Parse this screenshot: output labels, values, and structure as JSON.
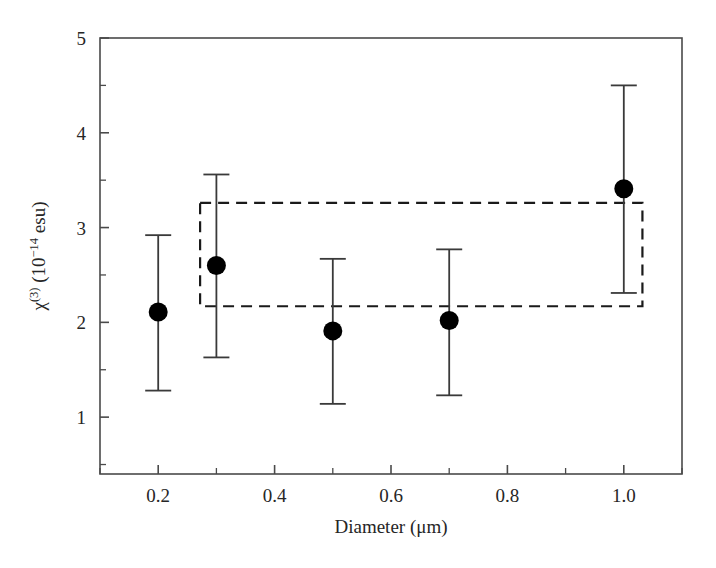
{
  "chart_data": {
    "type": "scatter",
    "title": "",
    "xlabel": "Diameter (μm)",
    "ylabel_parts": {
      "symbol": "χ",
      "symbol_sup": "(3)",
      "unit_open": " (10",
      "unit_sup": "−14",
      "unit_close": " esu)"
    },
    "ylabel": "χ(3) (10−14 esu)",
    "xlim": [
      0.1,
      1.1
    ],
    "ylim": [
      0.4,
      5.0
    ],
    "xticks": [
      0.2,
      0.4,
      0.6,
      0.8,
      1.0
    ],
    "xtick_labels": [
      "0.2",
      "0.4",
      "0.6",
      "0.8",
      "1.0"
    ],
    "xminor_step": 0.1,
    "yticks": [
      1,
      2,
      3,
      4,
      5
    ],
    "ytick_labels": [
      "1",
      "2",
      "3",
      "4",
      "5"
    ],
    "yminor_step": 0.5,
    "grid": false,
    "legend": false,
    "marker": "filled-circle",
    "marker_color": "#000000",
    "errorbar_color": "#3a3a3a",
    "frame_color": "#4a4a4a",
    "x": [
      0.2,
      0.3,
      0.5,
      0.7,
      1.0
    ],
    "values": [
      2.11,
      2.6,
      1.91,
      2.02,
      3.41
    ],
    "err_upper": [
      2.92,
      3.56,
      2.67,
      2.77,
      4.5
    ],
    "err_lower": [
      1.28,
      1.63,
      1.14,
      1.23,
      2.31
    ],
    "annotations": [
      {
        "name": "dashed-reference-box",
        "type": "rect",
        "style": "dashed",
        "x0": 0.272,
        "x1": 1.032,
        "y0": 2.17,
        "y1": 3.26,
        "color": "#1a1a1a"
      }
    ]
  }
}
